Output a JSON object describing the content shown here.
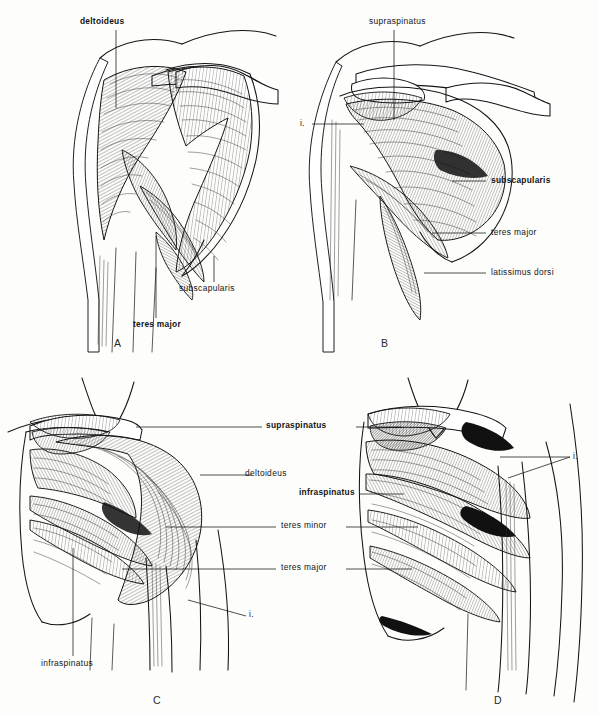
{
  "plate": {
    "title": "Shoulder musculature, anterior and posterior views",
    "background_color": "#fdfdfb",
    "ink_color": "#141414",
    "panel_count": 4
  },
  "panels": [
    {
      "letter": "A",
      "view": "anterior-deltoid-reflected",
      "labels": [
        {
          "text": "deltoideus",
          "bold": true,
          "id": "a-deltoideus"
        },
        {
          "text": "subscapularis",
          "bold": false,
          "id": "a-subscapularis"
        },
        {
          "text": "teres major",
          "bold": true,
          "id": "a-teres-major"
        }
      ]
    },
    {
      "letter": "B",
      "view": "anterior-deep-subscapularis",
      "labels": [
        {
          "text": "supraspinatus",
          "bold": false,
          "id": "b-supraspinatus"
        },
        {
          "text": "i.",
          "bold": false,
          "id": "b-insertion"
        },
        {
          "text": "subscapularis",
          "bold": true,
          "id": "b-subscapularis"
        },
        {
          "text": "teres major",
          "bold": false,
          "id": "b-teres-major"
        },
        {
          "text": "latissimus dorsi",
          "bold": false,
          "id": "b-latissimus-dorsi"
        }
      ]
    },
    {
      "letter": "C",
      "view": "posterior-superficial",
      "labels": [
        {
          "text": "supraspinatus",
          "bold": true,
          "id": "c-supraspinatus"
        },
        {
          "text": "deltoideus",
          "bold": false,
          "id": "c-deltoideus"
        },
        {
          "text": "teres minor",
          "bold": false,
          "id": "c-teres-minor"
        },
        {
          "text": "teres major",
          "bold": false,
          "id": "c-teres-major"
        },
        {
          "text": "i.",
          "bold": false,
          "id": "c-insertion"
        },
        {
          "text": "infraspinatus",
          "bold": false,
          "id": "c-infraspinatus"
        }
      ]
    },
    {
      "letter": "D",
      "view": "posterior-deep-infraspinatus",
      "labels": [
        {
          "text": "infraspinatus",
          "bold": true,
          "id": "d-infraspinatus"
        },
        {
          "text": "i.",
          "bold": false,
          "id": "d-insertion"
        }
      ]
    }
  ],
  "shared_labels": {
    "supraspinatus": "supraspinatus",
    "infraspinatus": "infraspinatus",
    "teres_minor": "teres minor",
    "teres_major": "teres major",
    "deltoideus": "deltoideus",
    "subscapularis": "subscapularis",
    "latissimus_dorsi": "latissimus dorsi",
    "insertion_abbrev": "i."
  },
  "panel_letters": {
    "a": "A",
    "b": "B",
    "c": "C",
    "d": "D"
  }
}
